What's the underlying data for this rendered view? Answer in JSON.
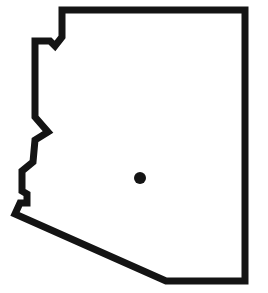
{
  "map": {
    "subject": "Arizona state outline",
    "outline": {
      "stroke_color": "#141414",
      "fill_color": "#ffffff",
      "stroke_width": 7,
      "points": [
        [
          62,
          10
        ],
        [
          245,
          10
        ],
        [
          245,
          281
        ],
        [
          166,
          281
        ],
        [
          15,
          214
        ],
        [
          20,
          203
        ],
        [
          27,
          203
        ],
        [
          27,
          194
        ],
        [
          22,
          191
        ],
        [
          22,
          171
        ],
        [
          33,
          162
        ],
        [
          35,
          140
        ],
        [
          48,
          132
        ],
        [
          35,
          117
        ],
        [
          35,
          41
        ],
        [
          50,
          41
        ],
        [
          55,
          46
        ],
        [
          62,
          37
        ]
      ]
    },
    "marker": {
      "label": "location marker",
      "cx": 140,
      "cy": 178,
      "r": 6,
      "color": "#141414"
    }
  }
}
